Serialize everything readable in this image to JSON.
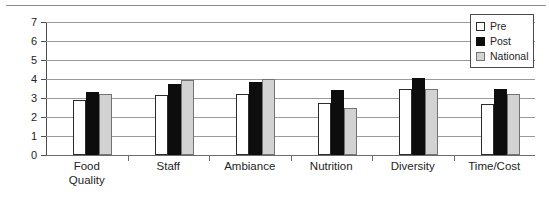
{
  "chart_data": {
    "type": "bar",
    "title": "",
    "subtitle": "",
    "xlabel": "",
    "ylabel": "",
    "ylim": [
      0,
      7
    ],
    "ytick_labels": [
      "0",
      "1",
      "2",
      "3",
      "4",
      "5",
      "6",
      "7"
    ],
    "yticks": [
      0,
      1,
      2,
      3,
      4,
      5,
      6,
      7
    ],
    "grid": true,
    "legend_position": "top-right",
    "categories": [
      "Food\nQuality",
      "Staff",
      "Ambiance",
      "Nutrition",
      "Diversity",
      "Time/Cost"
    ],
    "series": [
      {
        "name": "Pre",
        "color": "#ffffff",
        "edge_color": "#2b2b2b",
        "values": [
          2.9,
          3.15,
          3.2,
          2.75,
          3.5,
          2.7
        ]
      },
      {
        "name": "Post",
        "color": "#0d0d0d",
        "edge_color": "#0d0d0d",
        "values": [
          3.3,
          3.75,
          3.85,
          3.4,
          4.05,
          3.5
        ]
      },
      {
        "name": "National",
        "color": "#d2d2d2",
        "edge_color": "#737373",
        "values": [
          3.2,
          3.95,
          4.0,
          2.45,
          3.5,
          3.2
        ]
      }
    ]
  },
  "legend": {
    "items": [
      {
        "label": "Pre",
        "swatch": "pre"
      },
      {
        "label": "Post",
        "swatch": "post"
      },
      {
        "label": "National",
        "swatch": "national"
      }
    ]
  },
  "axis": {
    "y_tick_0": "0",
    "y_tick_1": "1",
    "y_tick_2": "2",
    "y_tick_3": "3",
    "y_tick_4": "4",
    "y_tick_5": "5",
    "y_tick_6": "6",
    "y_tick_7": "7"
  }
}
